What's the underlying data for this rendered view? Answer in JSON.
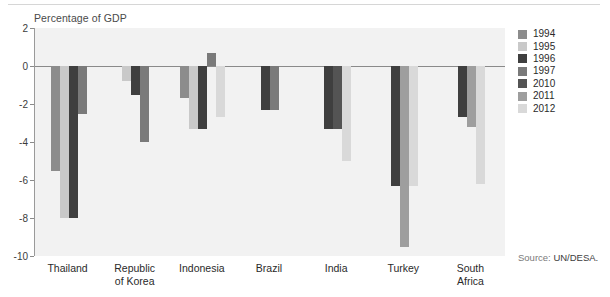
{
  "axis_title": "Percentage of GDP",
  "source": {
    "label": "Source:",
    "value": "UN/DESA."
  },
  "legend": {
    "position": "right",
    "entries": [
      {
        "label": "1994",
        "color": "#8c8c8c"
      },
      {
        "label": "1995",
        "color": "#c9c9c9"
      },
      {
        "label": "1996",
        "color": "#3f3f3f"
      },
      {
        "label": "1997",
        "color": "#7a7a7a"
      },
      {
        "label": "2010",
        "color": "#545454"
      },
      {
        "label": "2011",
        "color": "#9e9e9e"
      },
      {
        "label": "2012",
        "color": "#d9d9d9"
      }
    ]
  },
  "chart_data": {
    "type": "bar",
    "title": "",
    "subtitle": "",
    "xlabel": "",
    "ylabel": "Percentage of GDP",
    "ylim": [
      -10,
      2
    ],
    "yticks": [
      2,
      0,
      -2,
      -4,
      -6,
      -8,
      -10
    ],
    "ytick_labels": [
      "2",
      "0",
      "-2",
      "-4",
      "-6",
      "-8",
      "-10"
    ],
    "grid": false,
    "zero_line": true,
    "categories": [
      "Thailand",
      "Republic of Korea",
      "Indonesia",
      "Brazil",
      "India",
      "Turkey",
      "South Africa"
    ],
    "category_label_lines": [
      [
        "Thailand"
      ],
      [
        "Republic",
        "of Korea"
      ],
      [
        "Indonesia"
      ],
      [
        "Brazil"
      ],
      [
        "India"
      ],
      [
        "Turkey"
      ],
      [
        "South",
        "Africa"
      ]
    ],
    "series": [
      {
        "name": "1994",
        "color": "#8c8c8c",
        "values": [
          -5.5,
          null,
          -1.7,
          null,
          null,
          null,
          null
        ]
      },
      {
        "name": "1995",
        "color": "#c9c9c9",
        "values": [
          -8.0,
          -0.8,
          -3.3,
          null,
          null,
          null,
          null
        ]
      },
      {
        "name": "1996",
        "color": "#3f3f3f",
        "values": [
          -8.0,
          -1.5,
          -3.3,
          -2.3,
          -3.3,
          -6.3,
          -2.7
        ]
      },
      {
        "name": "1997",
        "color": "#7a7a7a",
        "values": [
          -2.5,
          -4.0,
          0.7,
          -2.3,
          null,
          null,
          null
        ]
      },
      {
        "name": "2010",
        "color": "#545454",
        "values": [
          null,
          null,
          null,
          null,
          -3.3,
          null,
          null
        ]
      },
      {
        "name": "2011",
        "color": "#9e9e9e",
        "values": [
          null,
          null,
          null,
          null,
          null,
          -9.5,
          -3.2
        ]
      },
      {
        "name": "2012",
        "color": "#d9d9d9",
        "values": [
          null,
          null,
          -2.7,
          null,
          -5.0,
          -6.3,
          -6.2
        ]
      }
    ]
  }
}
